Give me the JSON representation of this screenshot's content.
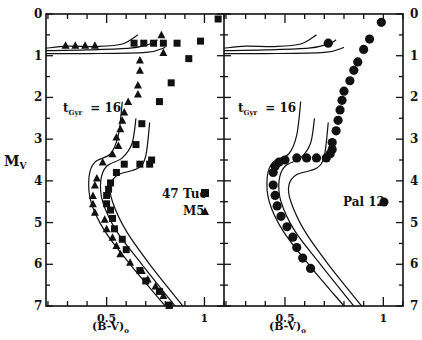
{
  "chart_data": [
    {
      "type": "scatter",
      "panel": "left",
      "title": "",
      "xlabel": "(B-V)o",
      "ylabel": "Mv",
      "xlim": [
        0.19,
        1.1
      ],
      "ylim": [
        7,
        0
      ],
      "x_ticks": [
        0.5,
        1
      ],
      "x_tick_labels": [
        "0.5",
        "1"
      ],
      "y_ticks": [
        0,
        1,
        2,
        3,
        4,
        5,
        6,
        7
      ],
      "y_tick_labels": [
        "0",
        "1",
        "2",
        "3",
        "4",
        "5",
        "6",
        "7"
      ],
      "annotation": "tGyr = 16",
      "legend": [
        {
          "label": "47 Tuc",
          "marker": "square"
        },
        {
          "label": "M5",
          "marker": "triangle"
        }
      ],
      "series": [
        {
          "name": "47 Tuc",
          "marker": "square",
          "points": [
            [
              1.07,
              0.12
            ],
            [
              0.98,
              0.65
            ],
            [
              0.86,
              0.7
            ],
            [
              0.79,
              0.7
            ],
            [
              0.74,
              0.7
            ],
            [
              0.69,
              0.7
            ],
            [
              0.64,
              0.7
            ],
            [
              0.92,
              1.07
            ],
            [
              0.83,
              1.65
            ],
            [
              0.77,
              2.1
            ],
            [
              0.68,
              2.63
            ],
            [
              0.65,
              3.13
            ],
            [
              0.67,
              3.6
            ],
            [
              0.72,
              3.6
            ],
            [
              0.73,
              3.5
            ],
            [
              0.59,
              3.6
            ],
            [
              0.55,
              3.8
            ],
            [
              0.52,
              4.05
            ],
            [
              0.51,
              4.2
            ],
            [
              0.5,
              4.35
            ],
            [
              0.5,
              4.55
            ],
            [
              0.52,
              4.7
            ],
            [
              0.53,
              4.9
            ],
            [
              0.54,
              5.15
            ],
            [
              0.58,
              5.4
            ],
            [
              0.6,
              5.65
            ],
            [
              0.67,
              6.15
            ],
            [
              0.7,
              6.4
            ],
            [
              0.77,
              6.65
            ],
            [
              0.82,
              6.98
            ]
          ]
        },
        {
          "name": "M5",
          "marker": "triangle",
          "points": [
            [
              0.29,
              0.75
            ],
            [
              0.34,
              0.75
            ],
            [
              0.39,
              0.75
            ],
            [
              0.44,
              0.75
            ],
            [
              0.78,
              0.5
            ],
            [
              0.79,
              0.92
            ],
            [
              0.67,
              1.1
            ],
            [
              0.67,
              1.35
            ],
            [
              0.66,
              1.7
            ],
            [
              0.66,
              1.92
            ],
            [
              0.61,
              2.1
            ],
            [
              0.59,
              2.35
            ],
            [
              0.58,
              2.55
            ],
            [
              0.57,
              2.75
            ],
            [
              0.55,
              2.95
            ],
            [
              0.56,
              3.15
            ],
            [
              0.53,
              3.35
            ],
            [
              0.48,
              3.55
            ],
            [
              0.45,
              3.93
            ],
            [
              0.44,
              4.1
            ],
            [
              0.43,
              4.35
            ],
            [
              0.43,
              4.55
            ],
            [
              0.44,
              4.75
            ],
            [
              0.49,
              4.92
            ],
            [
              0.5,
              5.15
            ],
            [
              0.53,
              5.35
            ],
            [
              0.55,
              5.55
            ],
            [
              0.57,
              5.75
            ],
            [
              0.62,
              5.95
            ],
            [
              0.68,
              6.15
            ],
            [
              0.71,
              6.35
            ],
            [
              0.75,
              6.52
            ],
            [
              0.79,
              6.75
            ],
            [
              0.82,
              6.98
            ]
          ]
        }
      ],
      "isochrones": "three solid curves (tGyr = 16) bracketing main sequence, subgiant and horizontal branches"
    },
    {
      "type": "scatter",
      "panel": "right",
      "title": "",
      "xlabel": "(B-V)o",
      "ylabel": "",
      "xlim": [
        0.19,
        1.1
      ],
      "ylim": [
        7,
        0
      ],
      "x_ticks": [
        0.5,
        1
      ],
      "x_tick_labels": [
        "0.5",
        "1"
      ],
      "y_ticks": [
        0,
        1,
        2,
        3,
        4,
        5,
        6,
        7
      ],
      "y_tick_labels": [
        "0",
        "1",
        "2",
        "3",
        "4",
        "5",
        "6",
        "7"
      ],
      "y_axis_side": "right",
      "annotation": "tGyr = 16",
      "legend": [
        {
          "label": "Pal 12",
          "marker": "circle"
        }
      ],
      "series": [
        {
          "name": "Pal 12",
          "marker": "circle",
          "points": [
            [
              0.99,
              0.2
            ],
            [
              0.93,
              0.6
            ],
            [
              0.9,
              0.85
            ],
            [
              0.72,
              0.7
            ],
            [
              0.87,
              1.15
            ],
            [
              0.85,
              1.35
            ],
            [
              0.83,
              1.6
            ],
            [
              0.8,
              1.85
            ],
            [
              0.79,
              2.07
            ],
            [
              0.78,
              2.3
            ],
            [
              0.77,
              2.55
            ],
            [
              0.76,
              2.8
            ],
            [
              0.74,
              3.08
            ],
            [
              0.74,
              3.25
            ],
            [
              0.73,
              3.35
            ],
            [
              0.71,
              3.45
            ],
            [
              0.66,
              3.45
            ],
            [
              0.61,
              3.45
            ],
            [
              0.56,
              3.45
            ],
            [
              0.5,
              3.5
            ],
            [
              0.47,
              3.55
            ],
            [
              0.45,
              3.65
            ],
            [
              0.44,
              3.8
            ],
            [
              0.44,
              4.1
            ],
            [
              0.45,
              4.35
            ],
            [
              0.46,
              4.6
            ],
            [
              0.48,
              4.85
            ],
            [
              0.51,
              5.1
            ],
            [
              0.54,
              5.35
            ],
            [
              0.56,
              5.6
            ],
            [
              0.59,
              5.85
            ],
            [
              0.63,
              6.1
            ]
          ]
        }
      ],
      "isochrones": "three solid curves (tGyr = 16) bracketing main sequence, subgiant and horizontal branches"
    }
  ],
  "labels": {
    "ylabel_main": "M",
    "ylabel_sub": "V",
    "xlabel_left": "(B-V)",
    "xlabel_right": "(B-V)",
    "xlabel_sub": "o",
    "age_left_t": "t",
    "age_left_sub": "Gyr",
    "age_left_val": "= 16",
    "age_right_t": "t",
    "age_right_sub": "Gyr",
    "age_right_val": "= 16",
    "legend_47tuc": "47 Tuc",
    "legend_m5": "M5",
    "legend_pal12": "Pal 12",
    "xtick_05": "0.5",
    "xtick_1": "1"
  }
}
